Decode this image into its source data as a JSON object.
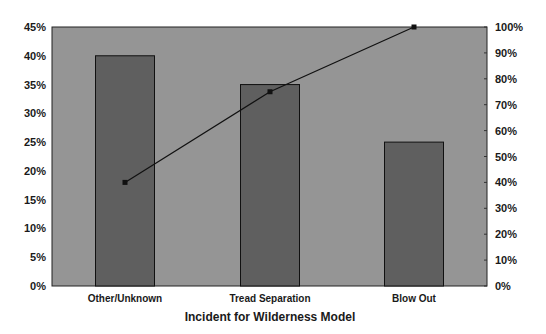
{
  "chart_data": {
    "type": "bar",
    "subtype": "pareto",
    "title": "",
    "xlabel": "Incident for Wilderness Model",
    "ylabel": "",
    "y2label": "",
    "categories": [
      "Other/Unknown",
      "Tread Separation",
      "Blow Out"
    ],
    "series": [
      {
        "name": "Share of incidents",
        "type": "bar",
        "axis": "left",
        "values": [
          40,
          35,
          25
        ]
      },
      {
        "name": "Cumulative %",
        "type": "line",
        "axis": "right",
        "values": [
          40,
          75,
          100
        ]
      }
    ],
    "ylim": [
      0,
      45
    ],
    "y2lim": [
      0,
      100
    ],
    "y_ticks": [
      "0%",
      "5%",
      "10%",
      "15%",
      "20%",
      "25%",
      "30%",
      "35%",
      "40%",
      "45%"
    ],
    "y2_ticks": [
      "0%",
      "10%",
      "20%",
      "30%",
      "40%",
      "50%",
      "60%",
      "70%",
      "80%",
      "90%",
      "100%"
    ],
    "grid": false,
    "legend": "none",
    "colors": {
      "plot_bg": "#959595",
      "bar": "#5f5f5f",
      "bar_edge": "#111111",
      "line": "#111111",
      "marker": "#111111"
    }
  }
}
